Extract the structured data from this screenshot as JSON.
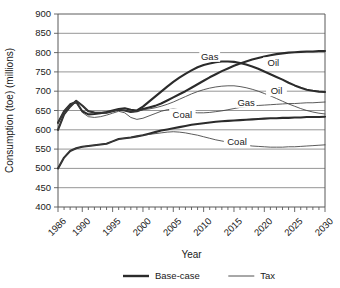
{
  "chart_data": {
    "type": "line",
    "title": "",
    "xlabel": "Year",
    "ylabel": "Consumption (toe) (millions)",
    "xlim": [
      1986,
      2030
    ],
    "ylim": [
      400,
      900
    ],
    "grid": true,
    "legend_position": "bottom",
    "y_ticks": [
      400,
      450,
      500,
      550,
      600,
      650,
      700,
      750,
      800,
      850,
      900
    ],
    "x_ticks_labeled": [
      1986,
      1990,
      1995,
      2000,
      2005,
      2010,
      2015,
      2020,
      2025,
      2030
    ],
    "x_tick_interval": 1,
    "legend": [
      {
        "name": "Base-case",
        "style": "thick"
      },
      {
        "name": "Tax",
        "style": "thin"
      }
    ],
    "annotations": [
      {
        "text": "Gas",
        "x": 2011.0,
        "y": 789,
        "series": "Gas base-case"
      },
      {
        "text": "Oil",
        "x": 2021.5,
        "y": 772,
        "series": "Oil base-case"
      },
      {
        "text": "Oil",
        "x": 2022.0,
        "y": 700,
        "series": "Oil tax"
      },
      {
        "text": "Gas",
        "x": 2017.0,
        "y": 670,
        "series": "Gas tax"
      },
      {
        "text": "Coal",
        "x": 2006.5,
        "y": 639,
        "series": "Coal base-case"
      },
      {
        "text": "Coal",
        "x": 2015.5,
        "y": 568,
        "series": "Coal tax"
      }
    ],
    "x": [
      1986,
      1987,
      1988,
      1989,
      1990,
      1991,
      1992,
      1993,
      1994,
      1995,
      1996,
      1997,
      1998,
      1999,
      2000,
      2001,
      2002,
      2003,
      2004,
      2005,
      2006,
      2007,
      2008,
      2009,
      2010,
      2011,
      2012,
      2013,
      2014,
      2015,
      2016,
      2017,
      2018,
      2019,
      2020,
      2021,
      2022,
      2023,
      2024,
      2025,
      2026,
      2027,
      2028,
      2029,
      2030
    ],
    "series": [
      {
        "name": "Oil base-case",
        "style": "thick",
        "values": [
          600,
          640,
          660,
          675,
          663,
          648,
          645,
          644,
          644,
          648,
          652,
          650,
          646,
          648,
          654,
          658,
          662,
          668,
          676,
          684,
          692,
          700,
          709,
          718,
          727,
          736,
          744,
          752,
          759,
          766,
          772,
          777,
          782,
          786,
          790,
          793,
          796,
          798,
          800,
          801,
          802,
          803,
          803,
          804,
          804
        ]
      },
      {
        "name": "Gas base-case",
        "style": "thick",
        "values": [
          618,
          648,
          666,
          672,
          648,
          640,
          641,
          643,
          646,
          650,
          654,
          656,
          652,
          650,
          660,
          673,
          686,
          699,
          712,
          724,
          735,
          745,
          754,
          762,
          768,
          772,
          775,
          777,
          777,
          776,
          773,
          769,
          764,
          758,
          751,
          744,
          737,
          730,
          722,
          715,
          709,
          704,
          701,
          699,
          698
        ]
      },
      {
        "name": "Coal base-case",
        "style": "thick",
        "values": [
          500,
          528,
          545,
          552,
          556,
          558,
          560,
          562,
          564,
          570,
          576,
          578,
          580,
          583,
          586,
          590,
          594,
          598,
          601,
          604,
          607,
          610,
          613,
          615,
          617,
          619,
          621,
          622,
          623,
          624,
          625,
          626,
          627,
          628,
          629,
          630,
          630,
          631,
          631,
          632,
          632,
          633,
          633,
          633,
          634
        ]
      },
      {
        "name": "Oil tax",
        "style": "thin",
        "values": [
          600,
          640,
          660,
          675,
          663,
          648,
          645,
          644,
          644,
          648,
          652,
          650,
          646,
          648,
          652,
          654,
          657,
          661,
          666,
          672,
          679,
          686,
          693,
          699,
          704,
          708,
          711,
          713,
          714,
          714,
          712,
          709,
          705,
          700,
          694,
          688,
          681,
          674,
          667,
          661,
          655,
          650,
          646,
          643,
          641
        ]
      },
      {
        "name": "Gas tax",
        "style": "thin",
        "values": [
          618,
          648,
          666,
          672,
          645,
          634,
          632,
          634,
          638,
          643,
          648,
          644,
          632,
          627,
          630,
          636,
          642,
          648,
          652,
          654,
          652,
          648,
          645,
          644,
          644,
          645,
          647,
          649,
          652,
          655,
          658,
          660,
          662,
          663,
          664,
          665,
          666,
          667,
          668,
          668,
          669,
          670,
          670,
          671,
          672
        ]
      },
      {
        "name": "Coal tax",
        "style": "thin",
        "values": [
          500,
          528,
          545,
          552,
          556,
          558,
          560,
          562,
          564,
          570,
          576,
          578,
          580,
          583,
          586,
          588,
          590,
          592,
          594,
          595,
          594,
          592,
          589,
          586,
          582,
          578,
          574,
          571,
          568,
          565,
          562,
          560,
          558,
          557,
          556,
          555,
          555,
          555,
          556,
          556,
          557,
          558,
          559,
          560,
          561
        ]
      }
    ]
  }
}
